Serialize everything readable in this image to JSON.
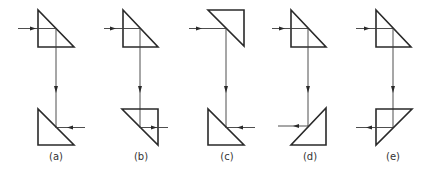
{
  "diagram": {
    "stroke_color": "#2a2a2a",
    "panels": [
      {
        "label": "(a)",
        "top_prism": "hypotenuse-right",
        "bottom_prism": "hypotenuse-right",
        "output_direction": "right",
        "arrow_direction": "left"
      },
      {
        "label": "(b)",
        "top_prism": "hypotenuse-right",
        "bottom_prism": "hypotenuse-left-inverted",
        "output_direction": "right",
        "arrow_direction": "right"
      },
      {
        "label": "(c)",
        "top_prism": "inverted-hypotenuse-left",
        "bottom_prism": "hypotenuse-right",
        "output_direction": "right",
        "arrow_direction": "left"
      },
      {
        "label": "(d)",
        "top_prism": "hypotenuse-right",
        "bottom_prism": "hypotenuse-left",
        "output_direction": "left",
        "arrow_direction": "left"
      },
      {
        "label": "(e)",
        "top_prism": "hypotenuse-right",
        "bottom_prism": "inverted-hypotenuse-right",
        "output_direction": "left",
        "arrow_direction": "left"
      }
    ]
  }
}
